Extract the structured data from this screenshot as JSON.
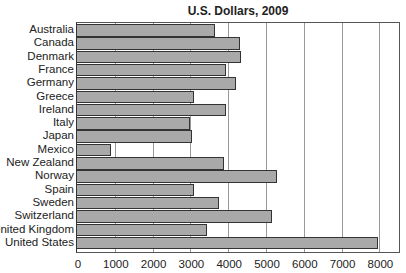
{
  "chart_data": {
    "type": "bar",
    "orientation": "horizontal",
    "title": "U.S. Dollars, 2009",
    "xlabel": "",
    "ylabel": "",
    "xlim": [
      0,
      8600
    ],
    "x_ticks": [
      "0",
      "1000",
      "2000",
      "3000",
      "4000",
      "5000",
      "6000",
      "7000",
      "8000"
    ],
    "grid": "vertical gridlines at each 1000",
    "categories": [
      "Australia",
      "Canada",
      "Denmark",
      "France",
      "Germany",
      "Greece",
      "Ireland",
      "Italy",
      "Japan",
      "Mexico",
      "New Zealand",
      "Norway",
      "Spain",
      "Sweden",
      "Switzerland",
      "United Kingdom",
      "United States"
    ],
    "values": [
      3650,
      4300,
      4350,
      3950,
      4200,
      3100,
      3950,
      3000,
      3050,
      900,
      3900,
      5300,
      3100,
      3750,
      5150,
      3450,
      7950
    ],
    "bar_color": "#a9a9a9",
    "edge_color": "#333333"
  }
}
